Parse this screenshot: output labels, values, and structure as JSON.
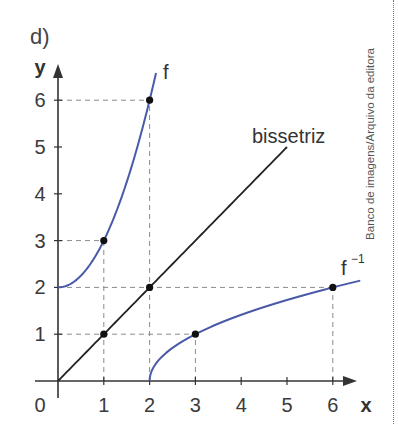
{
  "figure": {
    "part_label": "d)",
    "top_fragment": "4",
    "credit": "Banco de imagens/Arquivo da editora"
  },
  "chart_data": {
    "type": "line",
    "title": "d)",
    "xlabel": "x",
    "ylabel": "y",
    "xlim": [
      0,
      6.7
    ],
    "ylim": [
      0,
      7
    ],
    "x_ticks": [
      0,
      1,
      2,
      3,
      4,
      5,
      6
    ],
    "x_tick_labels": [
      "0",
      "1",
      "2",
      "3",
      "4",
      "5",
      "6"
    ],
    "y_ticks": [
      1,
      2,
      3,
      4,
      5,
      6
    ],
    "y_tick_labels": [
      "1",
      "2",
      "3",
      "4",
      "5",
      "6"
    ],
    "grid": false,
    "series": [
      {
        "name": "f",
        "label": "f",
        "color": "#4a5aa8",
        "function": "y = x^2 + 2, x >= 0",
        "x": [
          0,
          1,
          2,
          2.14
        ],
        "y": [
          2,
          3,
          6,
          6.58
        ],
        "marked_points": [
          [
            1,
            3
          ],
          [
            2,
            6
          ]
        ]
      },
      {
        "name": "bissetriz",
        "label": "bissetriz",
        "color": "#222222",
        "function": "y = x",
        "x": [
          0,
          1,
          2,
          5
        ],
        "y": [
          0,
          1,
          2,
          5
        ],
        "marked_points": [
          [
            1,
            1
          ],
          [
            2,
            2
          ]
        ]
      },
      {
        "name": "f^-1",
        "label": "f",
        "label_superscript": "−1",
        "color": "#4a5aa8",
        "function": "y = sqrt(x - 2), x >= 2",
        "x": [
          2,
          3,
          6,
          6.6
        ],
        "y": [
          0,
          1,
          2,
          2.14
        ],
        "marked_points": [
          [
            3,
            1
          ],
          [
            6,
            2
          ]
        ]
      }
    ],
    "guide_lines": [
      {
        "from": [
          0,
          6
        ],
        "to": [
          2,
          6
        ]
      },
      {
        "from": [
          2,
          0
        ],
        "to": [
          2,
          6
        ]
      },
      {
        "from": [
          0,
          3
        ],
        "to": [
          1,
          3
        ]
      },
      {
        "from": [
          1,
          0
        ],
        "to": [
          1,
          3
        ]
      },
      {
        "from": [
          0,
          2
        ],
        "to": [
          6,
          2
        ]
      },
      {
        "from": [
          6,
          0
        ],
        "to": [
          6,
          2
        ]
      },
      {
        "from": [
          0,
          1
        ],
        "to": [
          3,
          1
        ]
      },
      {
        "from": [
          3,
          0
        ],
        "to": [
          3,
          1
        ]
      }
    ],
    "annotations": [
      "f",
      "bissetriz",
      "f⁻¹"
    ]
  }
}
